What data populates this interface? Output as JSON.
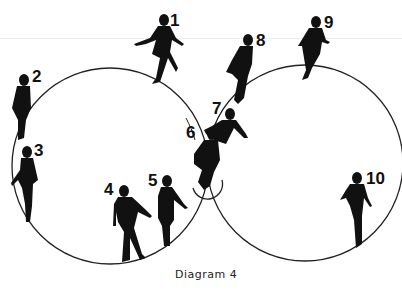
{
  "caption": "Diagram 4",
  "skater_labels": [
    {
      "id": 1,
      "label": "1"
    },
    {
      "id": 2,
      "label": "2"
    },
    {
      "id": 3,
      "label": "3"
    },
    {
      "id": 4,
      "label": "4"
    },
    {
      "id": 5,
      "label": "5"
    },
    {
      "id": 6,
      "label": "6"
    },
    {
      "id": 7,
      "label": "7"
    },
    {
      "id": 8,
      "label": "8"
    },
    {
      "id": 9,
      "label": "9"
    },
    {
      "id": 10,
      "label": "10"
    }
  ],
  "colors": {
    "line": "#222222",
    "figure": "#111111",
    "background": "#ffffff"
  }
}
